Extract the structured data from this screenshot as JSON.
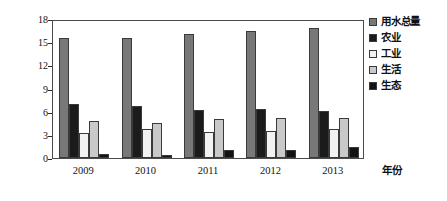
{
  "chart_data": {
    "type": "bar",
    "title": "",
    "xlabel": "年份",
    "ylabel": "水资源量（亿立方米）",
    "categories": [
      "2009",
      "2010",
      "2011",
      "2012",
      "2013"
    ],
    "ylim": [
      0,
      18
    ],
    "yticks": [
      0,
      3,
      6,
      9,
      12,
      15,
      18
    ],
    "ytick_labels": [
      "0",
      "3",
      "6",
      "9",
      "12",
      "15",
      "18"
    ],
    "grid": false,
    "legend_position": "right",
    "series": [
      {
        "name": "用水总量",
        "color": "#787878",
        "values": [
          15.6,
          15.6,
          16.1,
          16.4,
          16.9
        ]
      },
      {
        "name": "农业",
        "color": "#1b1b1b",
        "values": [
          7.0,
          6.8,
          6.2,
          6.3,
          6.1
        ]
      },
      {
        "name": "工业",
        "color": "#f2f2f2",
        "values": [
          3.2,
          3.8,
          3.4,
          3.5,
          3.75
        ]
      },
      {
        "name": "生活",
        "color": "#c9c9c9",
        "values": [
          4.8,
          4.5,
          5.1,
          5.2,
          5.15
        ]
      },
      {
        "name": "生态",
        "color": "#121212",
        "values": [
          0.5,
          0.45,
          1.0,
          1.0,
          1.4
        ]
      }
    ]
  }
}
